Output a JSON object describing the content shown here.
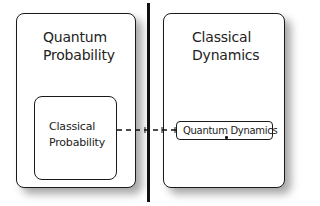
{
  "diagram": {
    "left_panel": {
      "label_lines": [
        "Quantum",
        "Probability"
      ],
      "inner_box": {
        "label_lines": [
          "Classical",
          "Probability"
        ]
      }
    },
    "right_panel": {
      "label_lines": [
        "Classical",
        "Dynamics"
      ],
      "inner_box": {
        "label": "Quantum Dynamics"
      }
    },
    "divider": {
      "type": "vertical-line"
    },
    "connector": {
      "style": "dashed",
      "from": "Classical Probability",
      "to": "Quantum Dynamics"
    },
    "colors": {
      "stroke": "#1a1a1a",
      "text": "#222222",
      "fill": "#ffffff",
      "shadow": "#8a8a8a"
    }
  }
}
